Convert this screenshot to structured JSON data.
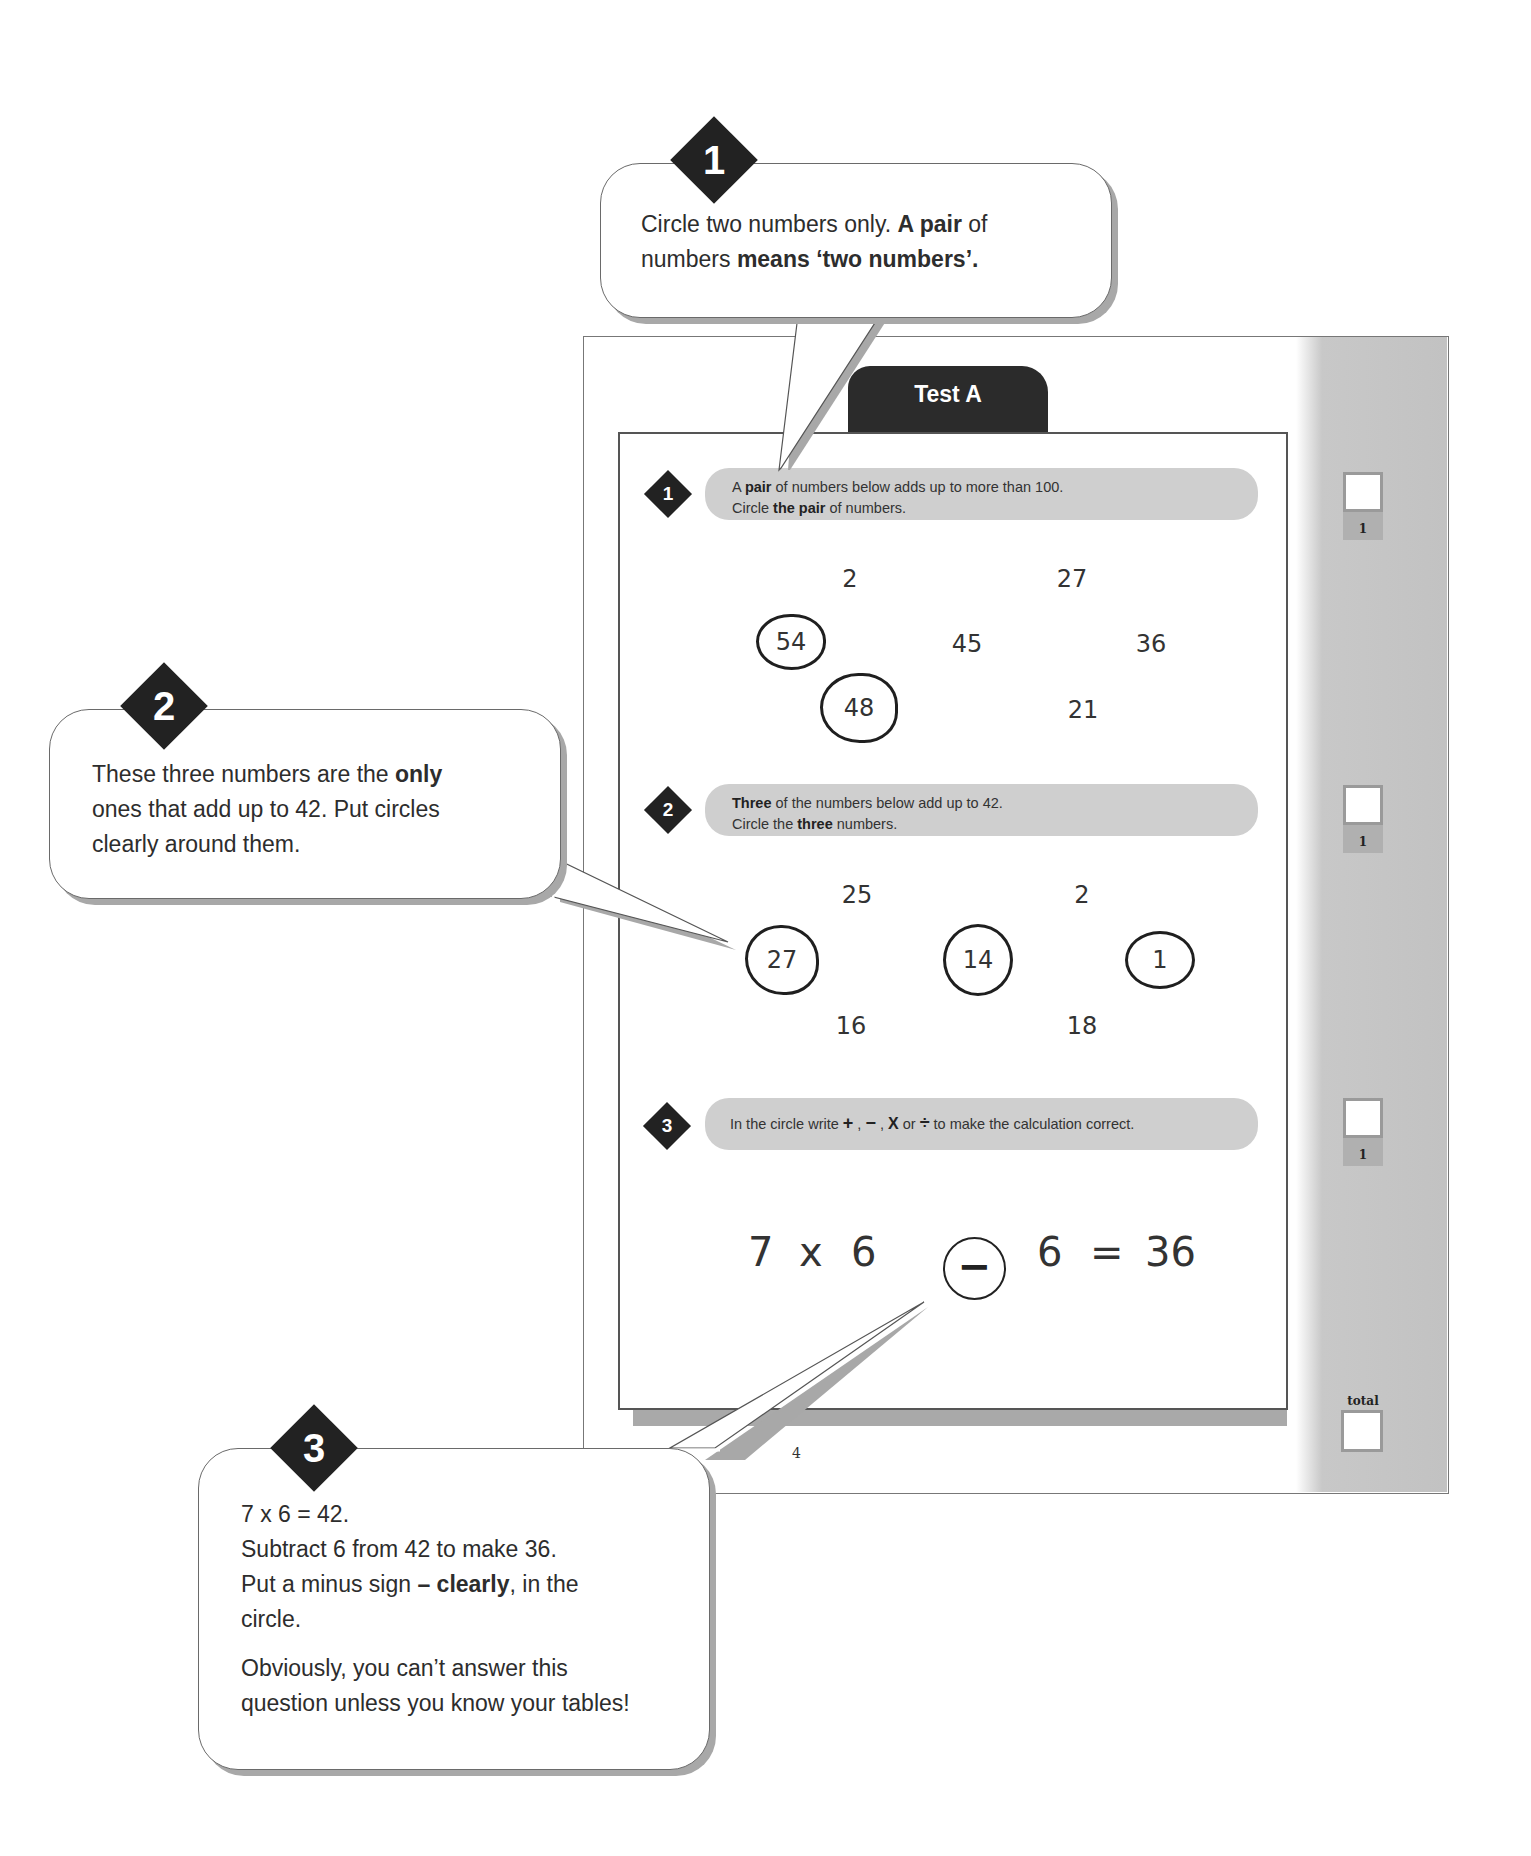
{
  "worksheet": {
    "tab_title": "Test A",
    "page_number": "4",
    "questions": [
      {
        "number": "1",
        "instruction_line1_parts": [
          "A ",
          "pair",
          " of numbers below adds up to more than 100."
        ],
        "instruction_line2_parts": [
          "Circle ",
          "the pair",
          " of numbers."
        ],
        "numbers": [
          {
            "value": "2",
            "circled": false
          },
          {
            "value": "27",
            "circled": false
          },
          {
            "value": "54",
            "circled": true
          },
          {
            "value": "45",
            "circled": false
          },
          {
            "value": "36",
            "circled": false
          },
          {
            "value": "48",
            "circled": true
          },
          {
            "value": "21",
            "circled": false
          }
        ],
        "score_label": "1"
      },
      {
        "number": "2",
        "instruction_line1_parts": [
          "Three",
          " of the numbers below add up to 42."
        ],
        "instruction_line2_parts": [
          "Circle the ",
          "three",
          " numbers."
        ],
        "numbers": [
          {
            "value": "25",
            "circled": false
          },
          {
            "value": "2",
            "circled": false
          },
          {
            "value": "27",
            "circled": true
          },
          {
            "value": "14",
            "circled": true
          },
          {
            "value": "1",
            "circled": true
          },
          {
            "value": "16",
            "circled": false
          },
          {
            "value": "18",
            "circled": false
          }
        ],
        "score_label": "1"
      },
      {
        "number": "3",
        "instruction_parts": [
          "In the circle write ",
          "+",
          " , ",
          "−",
          " , ",
          "X",
          "  or ",
          "÷",
          " to make the calculation correct."
        ],
        "equation": {
          "left": "7",
          "op1": "x",
          "b": "6",
          "answer_op": "−",
          "c": "6",
          "eq": "=",
          "result": "36"
        },
        "score_label": "1"
      }
    ],
    "total_label": "total"
  },
  "callouts": [
    {
      "number": "1",
      "parts": [
        "Circle two numbers only. ",
        "A pair",
        " of",
        "numbers ",
        "means ‘two numbers’."
      ]
    },
    {
      "number": "2",
      "parts": [
        "These three numbers are the ",
        "only",
        "ones that add up to 42. Put circles",
        "clearly around them."
      ]
    },
    {
      "number": "3",
      "lines": [
        "7 x 6 = 42.",
        "Subtract 6 from 42 to make 36."
      ],
      "line3_parts": [
        "Put a minus sign ",
        "– clearly",
        ", in the"
      ],
      "line4": "circle.",
      "para2_line1": "Obviously, you can’t answer this",
      "para2_line2": "question unless you know your tables!"
    }
  ]
}
